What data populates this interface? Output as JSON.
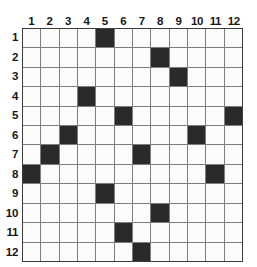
{
  "puzzle": {
    "title": "12x12 grid puzzle",
    "size": 12,
    "column_headers": [
      "1",
      "2",
      "3",
      "4",
      "5",
      "6",
      "7",
      "8",
      "9",
      "10",
      "11",
      "12"
    ],
    "row_headers": [
      "1",
      "2",
      "3",
      "4",
      "5",
      "6",
      "7",
      "8",
      "9",
      "10",
      "11",
      "12"
    ],
    "colors": {
      "filled": "#2a2a2a",
      "empty": "#fbfbfa",
      "gridline": "#7d7d7d",
      "border": "#3c3c3c",
      "label": "#171717"
    },
    "filled_cells": [
      {
        "row": 1,
        "col": 5
      },
      {
        "row": 2,
        "col": 8
      },
      {
        "row": 3,
        "col": 9
      },
      {
        "row": 4,
        "col": 4
      },
      {
        "row": 5,
        "col": 6
      },
      {
        "row": 5,
        "col": 12
      },
      {
        "row": 6,
        "col": 3
      },
      {
        "row": 6,
        "col": 10
      },
      {
        "row": 7,
        "col": 2
      },
      {
        "row": 7,
        "col": 7
      },
      {
        "row": 8,
        "col": 1
      },
      {
        "row": 8,
        "col": 11
      },
      {
        "row": 9,
        "col": 5
      },
      {
        "row": 10,
        "col": 8
      },
      {
        "row": 11,
        "col": 6
      },
      {
        "row": 12,
        "col": 7
      }
    ],
    "grid": [
      [
        0,
        0,
        0,
        0,
        1,
        0,
        0,
        0,
        0,
        0,
        0,
        0
      ],
      [
        0,
        0,
        0,
        0,
        0,
        0,
        0,
        1,
        0,
        0,
        0,
        0
      ],
      [
        0,
        0,
        0,
        0,
        0,
        0,
        0,
        0,
        1,
        0,
        0,
        0
      ],
      [
        0,
        0,
        0,
        1,
        0,
        0,
        0,
        0,
        0,
        0,
        0,
        0
      ],
      [
        0,
        0,
        0,
        0,
        0,
        1,
        0,
        0,
        0,
        0,
        0,
        1
      ],
      [
        0,
        0,
        1,
        0,
        0,
        0,
        0,
        0,
        0,
        1,
        0,
        0
      ],
      [
        0,
        1,
        0,
        0,
        0,
        0,
        1,
        0,
        0,
        0,
        0,
        0
      ],
      [
        1,
        0,
        0,
        0,
        0,
        0,
        0,
        0,
        0,
        0,
        1,
        0
      ],
      [
        0,
        0,
        0,
        0,
        1,
        0,
        0,
        0,
        0,
        0,
        0,
        0
      ],
      [
        0,
        0,
        0,
        0,
        0,
        0,
        0,
        1,
        0,
        0,
        0,
        0
      ],
      [
        0,
        0,
        0,
        0,
        0,
        1,
        0,
        0,
        0,
        0,
        0,
        0
      ],
      [
        0,
        0,
        0,
        0,
        0,
        0,
        1,
        0,
        0,
        0,
        0,
        0
      ]
    ]
  }
}
